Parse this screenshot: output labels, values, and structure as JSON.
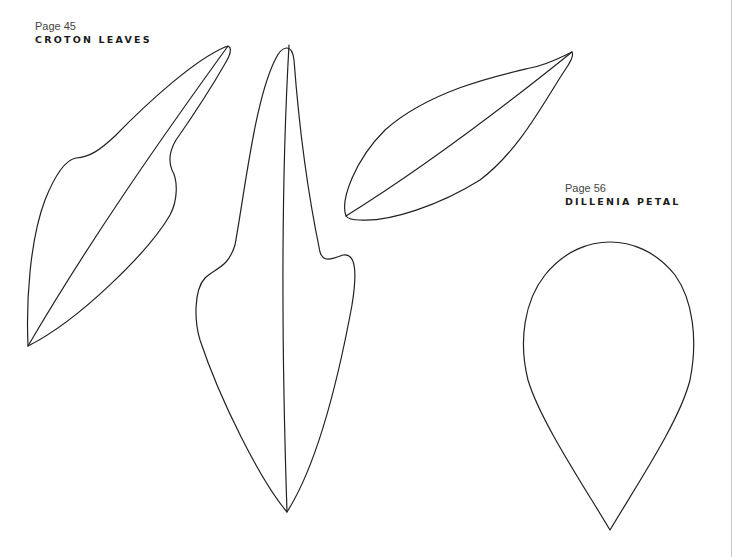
{
  "sections": [
    {
      "page_label": "Page 45",
      "title": "CROTON LEAVES"
    },
    {
      "page_label": "Page 56",
      "title": "DILLENIA PETAL"
    }
  ],
  "templates": [
    {
      "name": "croton-leaf-1",
      "section": "CROTON LEAVES"
    },
    {
      "name": "croton-leaf-2",
      "section": "CROTON LEAVES"
    },
    {
      "name": "croton-leaf-3",
      "section": "CROTON LEAVES"
    },
    {
      "name": "dillenia-petal",
      "section": "DILLENIA PETAL"
    }
  ],
  "colors": {
    "stroke": "#222222",
    "background": "#ffffff",
    "page_edge": "#c8c8c8"
  }
}
